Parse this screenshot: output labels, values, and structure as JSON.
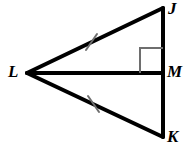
{
  "figure": {
    "background_color": "#ffffff",
    "stroke_color": "#000000",
    "tick_color": "#6e6e6e",
    "right_angle_color": "#6e6e6e",
    "width": 191,
    "height": 148,
    "vertices": [
      {
        "id": "J",
        "label": "J",
        "x": 163,
        "y": 8,
        "label_x": 168,
        "label_y": 0
      },
      {
        "id": "L",
        "label": "L",
        "x": 27,
        "y": 73,
        "label_x": 8,
        "label_y": 63
      },
      {
        "id": "M",
        "label": "M",
        "x": 163,
        "y": 73,
        "label_x": 167,
        "label_y": 63
      },
      {
        "id": "K",
        "label": "K",
        "x": 163,
        "y": 137,
        "label_x": 167,
        "label_y": 128
      }
    ],
    "segments": [
      {
        "id": "LJ",
        "from": "L",
        "to": "J",
        "x1": 27,
        "y1": 73,
        "x2": 163,
        "y2": 8,
        "width": 4,
        "tick_marks": 1
      },
      {
        "id": "LK",
        "from": "L",
        "to": "K",
        "x1": 27,
        "y1": 73,
        "x2": 163,
        "y2": 137,
        "width": 4,
        "tick_marks": 1
      },
      {
        "id": "LM",
        "from": "L",
        "to": "M",
        "x1": 27,
        "y1": 73,
        "x2": 163,
        "y2": 73,
        "width": 4,
        "tick_marks": 0
      },
      {
        "id": "JM",
        "from": "J",
        "to": "M",
        "x1": 163,
        "y1": 8,
        "x2": 163,
        "y2": 73,
        "width": 4,
        "tick_marks": 0
      },
      {
        "id": "MK",
        "from": "M",
        "to": "K",
        "x1": 163,
        "y1": 73,
        "x2": 163,
        "y2": 137,
        "width": 4,
        "tick_marks": 0
      }
    ],
    "tick_marks": [
      {
        "id": "tick-LJ",
        "on_segment": "LJ",
        "cx": 91,
        "cy": 42,
        "length": 17,
        "angle_deg": 19,
        "width": 2
      },
      {
        "id": "tick-LK",
        "on_segment": "LK",
        "cx": 93,
        "cy": 104,
        "length": 17,
        "angle_deg": -19,
        "width": 2
      }
    ],
    "angle_markers": [
      {
        "id": "right-angle-M",
        "at_vertex": "M",
        "type": "right-angle-square",
        "x": 140,
        "y": 48,
        "size": 17,
        "width": 2
      }
    ]
  }
}
